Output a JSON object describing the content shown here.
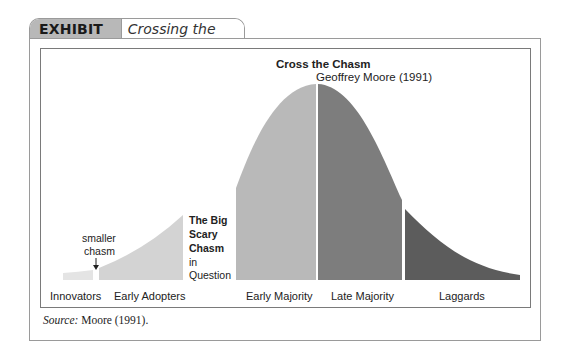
{
  "exhibit": {
    "label": "EXHIBIT C.4",
    "title": "Crossing the Chasm"
  },
  "diagram": {
    "heading": "Cross the Chasm",
    "author_line": "Geoffrey Moore (1991)",
    "small_chasm_line1": "smaller",
    "small_chasm_line2": "chasm",
    "big_chasm": {
      "line1": "The Big",
      "line2": "Scary",
      "line3": "Chasm",
      "line4": "in",
      "line5": "Question"
    },
    "segments": [
      {
        "label": "Innovators",
        "color": "#e4e4e4"
      },
      {
        "label": "Early Adopters",
        "color": "#d3d3d3"
      },
      {
        "label": "Early Majority",
        "color": "#b9b9b9"
      },
      {
        "label": "Late Majority",
        "color": "#7d7d7d"
      },
      {
        "label": "Laggards",
        "color": "#5c5c5c"
      }
    ]
  },
  "source": {
    "prefix": "Source:",
    "text": " Moore (1991)."
  }
}
